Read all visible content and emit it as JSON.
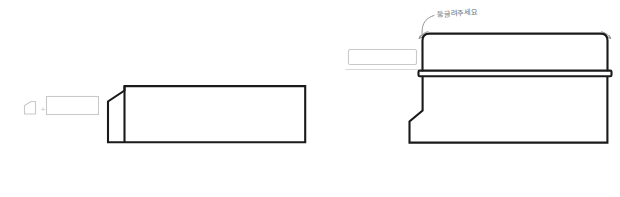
{
  "document": {
    "title": "Profile revision sketch",
    "background_color": "#ffffff",
    "line_color": "#1a1a1a",
    "ghost_line_color": "#c9c9c9",
    "annotation_color": "#8c8c8c"
  },
  "annotation": {
    "note_text": "둥글려주세요",
    "note_language": "Korean",
    "note_meaning": "Please round it",
    "leader_icon": "curved-leader-line",
    "corner_marks": [
      {
        "name": "top-left-corner-mark",
        "icon": "curved-arrow-icon"
      },
      {
        "name": "top-right-corner-mark",
        "icon": "curved-arrow-icon"
      }
    ]
  },
  "left_view": {
    "label": "before-profile",
    "badge_icon": "notched-profile-icon",
    "operator": "+",
    "ghost_block_label": "",
    "body_outline": "M 107 142 L 107 97.5 L 124.5 86.5 L 124.5 85 L 305 85 L 305 142 Z"
  },
  "right_view": {
    "label": "after-profile",
    "ghost_block_label": "",
    "has_rounded_top_corners": true,
    "divider_band_label": ""
  }
}
